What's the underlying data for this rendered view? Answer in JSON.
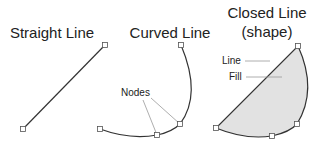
{
  "panels": {
    "straight": {
      "title": "Straight Line"
    },
    "curved": {
      "title": "Curved Line",
      "callout": "Nodes"
    },
    "closed": {
      "title_line1": "Closed Line",
      "title_line2": "(shape)",
      "callout_line": "Line",
      "callout_fill": "Fill"
    }
  },
  "colors": {
    "stroke": "#333333",
    "fill": "#e2e2e2",
    "leader": "#999999",
    "node_fill": "#ffffff"
  }
}
